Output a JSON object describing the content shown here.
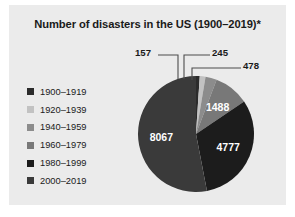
{
  "figure": {
    "background_color": "#ebebeb",
    "title": "Number of disasters in the US (1900–2019)*"
  },
  "legend": {
    "items": [
      {
        "label": "1900–1919",
        "color": "#2b2b2b"
      },
      {
        "label": "1920–1939",
        "color": "#c2c2c2"
      },
      {
        "label": "1940–1959",
        "color": "#8c8c8c"
      },
      {
        "label": "1960–1979",
        "color": "#787878"
      },
      {
        "label": "1980–1999",
        "color": "#1c1c1c"
      },
      {
        "label": "2000–2019",
        "color": "#3a3a3a"
      }
    ]
  },
  "chart_data": {
    "type": "pie",
    "title": "Number of disasters in the US (1900–2019)*",
    "xlabel": "",
    "ylabel": "",
    "legend_position": "left",
    "grid": false,
    "total": 15212,
    "start_angle_deg": 0,
    "direction": "clockwise",
    "categories": [
      "1900–1919",
      "1920–1939",
      "1940–1959",
      "1960–1979",
      "1980–1999",
      "2000–2019"
    ],
    "values": [
      157,
      245,
      478,
      1488,
      4777,
      8067
    ],
    "colors": [
      "#2b2b2b",
      "#c2c2c2",
      "#8c8c8c",
      "#787878",
      "#1c1c1c",
      "#3a3a3a"
    ],
    "labels": [
      "157",
      "245",
      "478",
      "1488",
      "4777",
      "8067"
    ],
    "label_placement": [
      "outside",
      "outside",
      "outside",
      "inside",
      "inside",
      "inside"
    ]
  },
  "callouts": {
    "first": "157",
    "second": "245",
    "third": "478"
  },
  "slice_labels": {
    "fourth": "1488",
    "fifth": "4777",
    "sixth": "8067"
  }
}
